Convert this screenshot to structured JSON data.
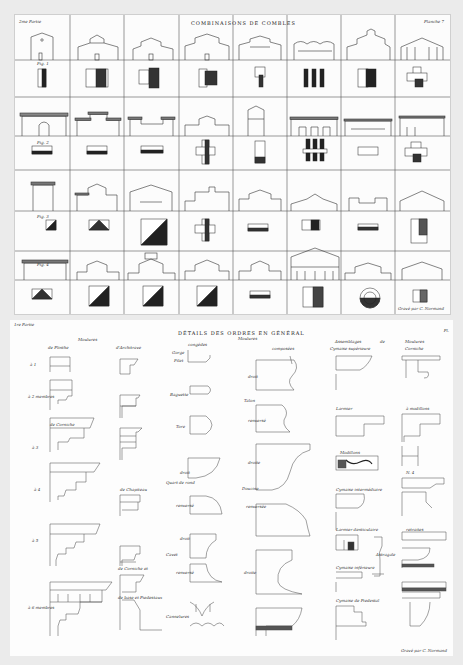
{
  "top_plate": {
    "part_label": "2me Partie",
    "title": "COMBINAISONS DE COMBLES",
    "plate_label": "Planche 7",
    "figure_labels": [
      "Fig. 1",
      "Fig. 2",
      "Fig. 3",
      "Fig. 4"
    ],
    "signature": "Gravé par C. Normand",
    "columns": 8,
    "rows": [
      {
        "type": "elevation",
        "figure": "Fig. 1"
      },
      {
        "type": "plan"
      },
      {
        "type": "elevation",
        "figure": "Fig. 2"
      },
      {
        "type": "plan"
      },
      {
        "type": "elevation",
        "figure": "Fig. 3"
      },
      {
        "type": "plan"
      },
      {
        "type": "elevation",
        "figure": "Fig. 4"
      },
      {
        "type": "plan"
      }
    ]
  },
  "bottom_plate": {
    "part_label": "1re Partie",
    "title": "DÉTAILS DES ORDRES EN GÉNÉRAL",
    "plate_label": "Pl.",
    "column_headers": {
      "moulures_a": "Moulures",
      "de_plinthe": "de Plinthe",
      "d_architrave": "d'Architrave",
      "moulures_b": "Moulures",
      "congedes": "congédes",
      "composees": "composées",
      "assemblages": "Assemblages",
      "de": "de",
      "moulures_c": "Moulures",
      "cymaise": "Cymaise supérieure",
      "corniche": "Corniche"
    },
    "row_labels": [
      "à 1",
      "à 2 membres",
      "de Corniche",
      "à 3",
      "à 4",
      "de Chapiteau",
      "à 5",
      "de Corniche et",
      "de base et Piedestaux",
      "à 6 membres"
    ],
    "molding_labels": [
      "Gorge",
      "Filet",
      "Baguette",
      "Tore",
      "droit",
      "Quart de rond",
      "renversé",
      "droit",
      "Cavet",
      "renversé",
      "Cannelures"
    ],
    "compound_labels": [
      "droit",
      "Talon",
      "renversé",
      "droite",
      "Doucine",
      "renversée",
      "droite"
    ],
    "assembly_labels": [
      "Larmier",
      "Modillons",
      "Cymaise intermédiaire",
      "Larmier denticulaire",
      "Astragale",
      "Cymaise inférieure",
      "Cymaise de Piedestal"
    ],
    "cornice_labels": [
      "à modillons",
      "N. 4",
      "retraites"
    ],
    "signature": "Gravé par C. Normand"
  }
}
